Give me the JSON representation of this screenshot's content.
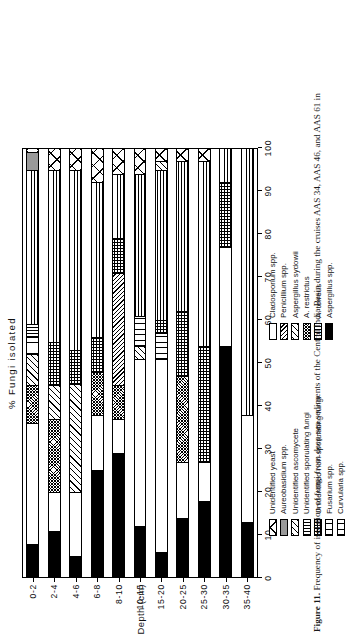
{
  "figure": {
    "caption_number": "Figure 11.",
    "caption_text": " Frequency of isolation of fungi from deep-sea sediments of the Central India Basin during the cruises AAS 34, AAS 46, and AAS 61 in"
  },
  "axes": {
    "x_title": "% Fungi isolated",
    "y_title": "Depth (cm)",
    "x_ticks": [
      "0",
      "10",
      "20",
      "30",
      "40",
      "50",
      "60",
      "70",
      "80",
      "90",
      "100"
    ]
  },
  "legend_left": {
    "items": [
      {
        "label": "Unidentified yeast",
        "pattern": "bigx"
      },
      {
        "label": "Aureobasidium spp.",
        "pattern": "grey"
      },
      {
        "label": "Unidentified ascomycete",
        "pattern": "diag-wide"
      },
      {
        "label": "Unidentified sporulating fungi",
        "pattern": "vert"
      },
      {
        "label": "Unidentified non-sporulating fungi",
        "pattern": "grid"
      },
      {
        "label": "Fusarium spp.",
        "pattern": "twoband"
      },
      {
        "label": "Curvularia spp.",
        "pattern": "twoband"
      }
    ]
  },
  "legend_right": {
    "items": [
      {
        "label": "Cladosporium spp.",
        "pattern": "white"
      },
      {
        "label": "Penicillium spp.",
        "pattern": "diag-dense"
      },
      {
        "label": "Aspergillus sydowii",
        "pattern": "diag-wide"
      },
      {
        "label": "A. restrictus",
        "pattern": "checker"
      },
      {
        "label": "A. terreus",
        "pattern": "vert"
      },
      {
        "label": "Aspergillus spp.",
        "pattern": "black"
      }
    ]
  },
  "chart_data": {
    "type": "bar",
    "orientation": "horizontal-stacked",
    "title": "",
    "xlabel": "% Fungi isolated",
    "ylabel": "Depth (cm)",
    "xlim": [
      0,
      100
    ],
    "grid": false,
    "legend_position": "below-plot",
    "categories": [
      "0-2",
      "2-4",
      "4-6",
      "6-8",
      "8-10",
      "10-15",
      "15-20",
      "20-25",
      "25-30",
      "30-35",
      "35-40"
    ],
    "series": [
      {
        "name": "Aspergillus spp.",
        "pattern": "black",
        "values": [
          8,
          11,
          5,
          25,
          29,
          12,
          6,
          14,
          18,
          54,
          13
        ]
      },
      {
        "name": "Cladosporium spp.",
        "pattern": "white",
        "values": [
          28,
          9,
          15,
          13,
          8,
          39,
          45,
          13,
          9,
          23,
          25
        ]
      },
      {
        "name": "A. restrictus",
        "pattern": "checker",
        "values": [
          9,
          17,
          0,
          10,
          8,
          0,
          0,
          20,
          0,
          0,
          0
        ]
      },
      {
        "name": "Aspergillus sydowii",
        "pattern": "diag-wide",
        "values": [
          7,
          8,
          25,
          0,
          0,
          3,
          0,
          0,
          0,
          0,
          0
        ]
      },
      {
        "name": "Penicillium spp.",
        "pattern": "diag-dense",
        "values": [
          0,
          0,
          0,
          0,
          26,
          0,
          0,
          0,
          0,
          0,
          0
        ]
      },
      {
        "name": "Fusarium spp.",
        "pattern": "twoband",
        "values": [
          4,
          0,
          0,
          0,
          0,
          7,
          6,
          0,
          0,
          0,
          0
        ]
      },
      {
        "name": "A. terreus",
        "pattern": "vert",
        "values": [
          3,
          0,
          0,
          0,
          0,
          0,
          0,
          0,
          0,
          0,
          0
        ]
      },
      {
        "name": "Unidentified non-sporulating fungi",
        "pattern": "grid",
        "values": [
          0,
          10,
          8,
          8,
          8,
          0,
          3,
          15,
          27,
          15,
          0
        ]
      },
      {
        "name": "Unidentified sporulating fungi",
        "pattern": "horz",
        "values": [
          36,
          40,
          42,
          36,
          15,
          33,
          35,
          35,
          43,
          8,
          62
        ]
      },
      {
        "name": "Unidentified ascomycete",
        "pattern": "diag-wide",
        "values": [
          0,
          0,
          0,
          0,
          0,
          0,
          2,
          0,
          0,
          0,
          0
        ]
      },
      {
        "name": "Aureobasidium spp.",
        "pattern": "grey",
        "values": [
          4,
          0,
          0,
          0,
          0,
          0,
          0,
          0,
          0,
          0,
          0
        ]
      },
      {
        "name": "Unidentified yeast",
        "pattern": "bigx",
        "values": [
          1,
          5,
          5,
          8,
          6,
          6,
          3,
          3,
          3,
          0,
          0
        ]
      }
    ]
  }
}
